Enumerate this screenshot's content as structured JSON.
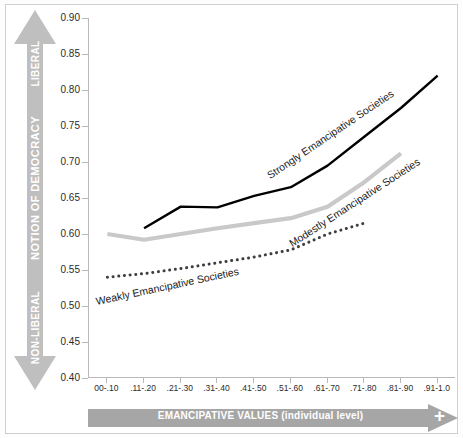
{
  "chart_data": {
    "type": "line",
    "title": "",
    "xlabel": "EMANCIPATIVE VALUES (individual level)",
    "ylabel": "NOTION OF DEMOCRACY",
    "ylim": [
      0.4,
      0.9
    ],
    "ytick_step": 0.05,
    "grid": false,
    "legend": "inline annotations on lines",
    "categories": [
      "00-.10",
      ".11-.20",
      ".21-.30",
      ".31-.40",
      ".41-.50",
      ".51-.60",
      ".61-.70",
      ".71-.80",
      ".81-.90",
      ".91-1.0"
    ],
    "ytick_labels": [
      "0.90",
      "0.85",
      "0.80",
      "0.75",
      "0.70",
      "0.65",
      "0.60",
      "0.55",
      "0.50",
      "0.45",
      "0.40"
    ],
    "ytick_values": [
      0.9,
      0.85,
      0.8,
      0.75,
      0.7,
      0.65,
      0.6,
      0.55,
      0.5,
      0.45,
      0.4
    ],
    "series": [
      {
        "name": "Strongly Emancipative Societies",
        "color": "#000000",
        "style": "solid",
        "width": 2.4,
        "x": [
          ".11-.20",
          ".21-.30",
          ".31-.40",
          ".41-.50",
          ".51-.60",
          ".61-.70",
          ".71-.80",
          ".81-.90",
          ".91-1.0"
        ],
        "values": [
          0.608,
          0.638,
          0.637,
          0.653,
          0.665,
          0.695,
          0.735,
          0.775,
          0.82
        ]
      },
      {
        "name": "Modestly Emancipative Societies",
        "color": "#c9c9c9",
        "style": "solid",
        "width": 4.2,
        "x": [
          "00-.10",
          ".11-.20",
          ".21-.30",
          ".31-.40",
          ".41-.50",
          ".51-.60",
          ".61-.70",
          ".71-.80",
          ".81-.90"
        ],
        "values": [
          0.6,
          0.592,
          0.6,
          0.608,
          0.615,
          0.622,
          0.638,
          0.672,
          0.712
        ]
      },
      {
        "name": "Weakly Emancipative Societies",
        "color": "#3f3f3f",
        "style": "dotted",
        "width": 3.0,
        "x": [
          "00-.10",
          ".11-.20",
          ".21-.30",
          ".31-.40",
          ".41-.50",
          ".51-.60",
          ".61-.70",
          ".71-.80"
        ],
        "values": [
          0.54,
          0.545,
          0.552,
          0.56,
          0.568,
          0.578,
          0.6,
          0.615
        ]
      }
    ],
    "annotations": [
      {
        "text": "Strongly Emancipative Societies",
        "series": "Strongly Emancipative Societies"
      },
      {
        "text": "Modestly Emancipative Societies",
        "series": "Modestly Emancipative Societies"
      },
      {
        "text": "Weakly Emancipative Societies",
        "series": "Weakly Emancipative Societies"
      }
    ]
  },
  "y_axis_arrow": {
    "top_label": "LIBERAL",
    "middle_label": "NOTION OF DEMOCRACY",
    "bottom_label": "NON-LIBERAL",
    "color": "#bfbfbf"
  },
  "x_axis_arrow": {
    "label": "EMANCIPATIVE VALUES (individual level)",
    "plus_sign": "+",
    "color": "#a6a6a6"
  },
  "colors": {
    "strong_line": "#000000",
    "modest_line": "#c9c9c9",
    "weak_line": "#3f3f3f",
    "axis": "#b9b9b9",
    "frame": "#cfcfcf"
  }
}
